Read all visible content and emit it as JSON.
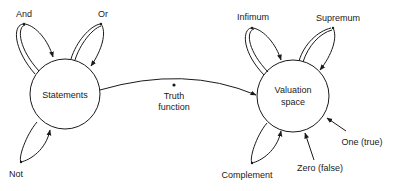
{
  "diagram": {
    "nodes": {
      "statements": {
        "label": "Statements"
      },
      "valuation": {
        "label_line1": "Valuation",
        "label_line2": "space"
      }
    },
    "edges": {
      "truth_function": {
        "label_line1": "Truth",
        "label_line2": "function"
      }
    },
    "statement_operators": {
      "and": "And",
      "or": "Or",
      "not": "Not"
    },
    "valuation_operators": {
      "infimum": "Infimum",
      "supremum": "Supremum",
      "complement": "Complement"
    },
    "constants": {
      "one": "One (true)",
      "zero": "Zero (false)"
    },
    "colors": {
      "stroke": "#1a1a1a",
      "background": "#ffffff"
    }
  }
}
